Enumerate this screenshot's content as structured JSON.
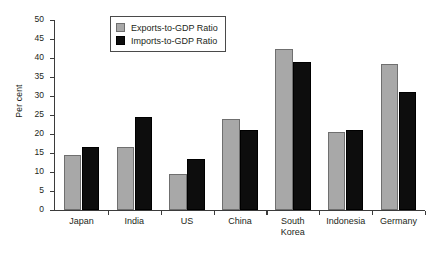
{
  "chart_data": {
    "type": "bar",
    "title": "",
    "xlabel": "",
    "ylabel": "Per cent",
    "ylim": [
      0,
      50
    ],
    "ytick_step": 5,
    "yticks": [
      "50",
      "45",
      "40",
      "35",
      "30",
      "25",
      "20",
      "15",
      "10",
      "5",
      "0"
    ],
    "grid": false,
    "legend_position": "top-left-inside",
    "categories": [
      "Japan",
      "India",
      "US",
      "China",
      "South Korea",
      "Indonesia",
      "Germany"
    ],
    "category_lines": [
      [
        "Japan"
      ],
      [
        "India"
      ],
      [
        "US"
      ],
      [
        "China"
      ],
      [
        "South",
        "Korea"
      ],
      [
        "Indonesia"
      ],
      [
        "Germany"
      ]
    ],
    "series": [
      {
        "name": "Exports-to-GDP Ratio",
        "color": "#a8a8a8",
        "values": [
          14.5,
          16.5,
          9.5,
          24.0,
          42.5,
          20.5,
          38.5
        ]
      },
      {
        "name": "Imports-to-GDP Ratio",
        "color": "#0d0d0d",
        "values": [
          16.5,
          24.5,
          13.5,
          21.0,
          39.0,
          21.0,
          31.0
        ]
      }
    ]
  },
  "legend": {
    "items": [
      {
        "label": "Exports-to-GDP Ratio"
      },
      {
        "label": "Imports-to-GDP Ratio"
      }
    ]
  },
  "axis": {
    "y_title": "Per cent"
  }
}
